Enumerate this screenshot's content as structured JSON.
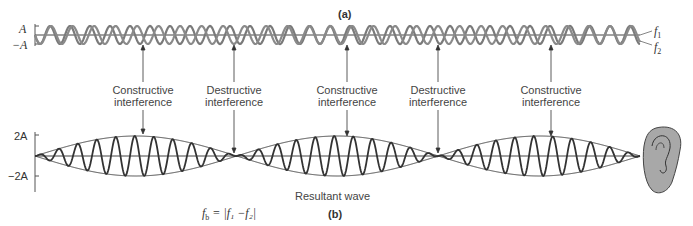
{
  "panel_a": {
    "label": "(a)",
    "axis_top": "A",
    "axis_bottom": "−A",
    "wave1_label": "f",
    "wave1_sub": "1",
    "wave2_label": "f",
    "wave2_sub": "2",
    "wave_color": "#7a7a7a"
  },
  "annotations": [
    {
      "line1": "Constructive",
      "line2": "interference",
      "x": 143
    },
    {
      "line1": "Destructive",
      "line2": "interference",
      "x": 234
    },
    {
      "line1": "Constructive",
      "line2": "interference",
      "x": 347
    },
    {
      "line1": "Destructive",
      "line2": "interference",
      "x": 438
    },
    {
      "line1": "Constructive",
      "line2": "interference",
      "x": 551
    }
  ],
  "panel_b": {
    "label": "(b)",
    "axis_top": "2A",
    "axis_bottom": "−2A",
    "caption": "Resultant wave",
    "formula": "fₕ = |f₁ − f₂|",
    "formula_lhs": "f",
    "formula_lhs_sub": "b",
    "formula_rhs": "= |f₁ −f₂|",
    "wave_color": "#333333",
    "ear_color": "#a8a8a8"
  }
}
